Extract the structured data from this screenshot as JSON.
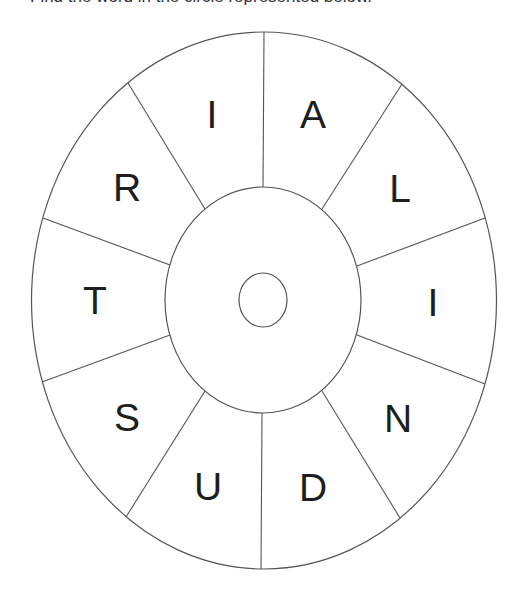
{
  "caption": "Find the word in the circle represented below.",
  "wheel": {
    "center": [
      263,
      300
    ],
    "outer": {
      "rx": 232,
      "ry": 269
    },
    "inner": {
      "rx": 98,
      "ry": 113
    },
    "hub": {
      "rx": 24,
      "ry": 27
    },
    "stroke_color": "#555555",
    "letter_color": "#1e1e1e",
    "segments": [
      {
        "letter": "A",
        "pos": [
          313,
          114
        ]
      },
      {
        "letter": "L",
        "pos": [
          400,
          188
        ]
      },
      {
        "letter": "I",
        "pos": [
          433,
          302
        ]
      },
      {
        "letter": "N",
        "pos": [
          398,
          418
        ]
      },
      {
        "letter": "D",
        "pos": [
          313,
          487
        ]
      },
      {
        "letter": "U",
        "pos": [
          208,
          486
        ]
      },
      {
        "letter": "S",
        "pos": [
          127,
          417
        ]
      },
      {
        "letter": "T",
        "pos": [
          95,
          300
        ]
      },
      {
        "letter": "R",
        "pos": [
          127,
          187
        ]
      },
      {
        "letter": "I",
        "pos": [
          212,
          114
        ]
      }
    ]
  }
}
